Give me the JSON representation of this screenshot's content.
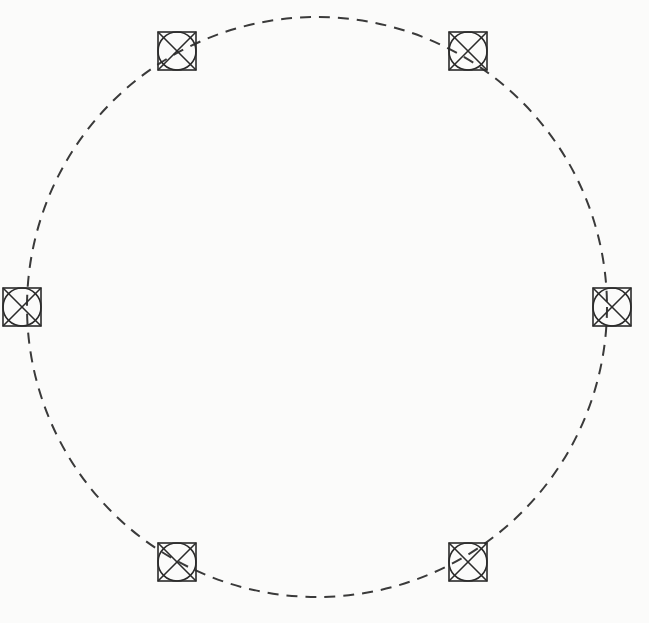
{
  "canvas": {
    "width": 649,
    "height": 623,
    "background_color": "#fbfbfa"
  },
  "diagram": {
    "title": "Ring topology diagram",
    "type": "ring-network",
    "stroke_color": "#2b2b2b",
    "ring": {
      "name": "dashed-ring-path",
      "center_x": 317,
      "center_y": 307,
      "radius": 290,
      "stroke_color": "#3a3a3a",
      "stroke_width": 2,
      "dash_length": 11,
      "gap_length": 8,
      "dash_array": "11 8",
      "fill": "none"
    },
    "node_marker": {
      "shape": "square-with-inscribed-circle-and-diagonals",
      "size": 38,
      "stroke_color": "#2b2b2b",
      "stroke_width": 1.6,
      "fill": "none"
    },
    "nodes": [
      {
        "id": "node-1",
        "label": "",
        "angle_deg": 240,
        "x": 177,
        "y": 51
      },
      {
        "id": "node-2",
        "label": "",
        "angle_deg": 300,
        "x": 468,
        "y": 51
      },
      {
        "id": "node-3",
        "label": "",
        "angle_deg": 0,
        "x": 612,
        "y": 307
      },
      {
        "id": "node-4",
        "label": "",
        "angle_deg": 60,
        "x": 468,
        "y": 562
      },
      {
        "id": "node-5",
        "label": "",
        "angle_deg": 120,
        "x": 177,
        "y": 562
      },
      {
        "id": "node-6",
        "label": "",
        "angle_deg": 180,
        "x": 22,
        "y": 307
      }
    ]
  },
  "footer_rule": {
    "name": "horizontal-rule",
    "x_start": 0,
    "x_end": 252,
    "y": 617,
    "thickness": 1.5,
    "color": "#1c1c1c"
  }
}
